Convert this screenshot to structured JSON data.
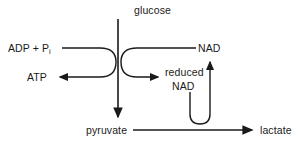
{
  "diagram": {
    "colors": {
      "stroke": "#1a1a1a",
      "text": "#1a1a1a",
      "background": "#ffffff"
    },
    "labels": {
      "glucose": "glucose",
      "adp_prefix": "ADP + P",
      "adp_subscript": "i",
      "atp": "ATP",
      "nad": "NAD",
      "reduced": "reduced",
      "reduced_nad_second_line": "NAD",
      "pyruvate": "pyruvate",
      "lactate": "lactate"
    },
    "arrows": [
      {
        "name": "glucose-to-pyruvate",
        "direction": "down"
      },
      {
        "name": "adp-pi-to-atp",
        "direction": "curved-left"
      },
      {
        "name": "nad-to-reduced-nad",
        "direction": "curved-right"
      },
      {
        "name": "reduced-nad-to-nad",
        "direction": "u-turn-up"
      },
      {
        "name": "pyruvate-to-lactate",
        "direction": "right"
      }
    ]
  }
}
